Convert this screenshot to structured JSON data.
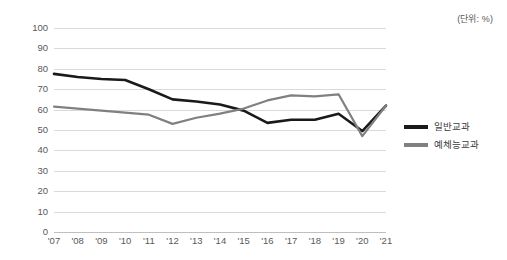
{
  "unit_note": "(단위: %)",
  "chart_data": {
    "type": "line",
    "title": "",
    "subtitle": "",
    "xlabel": "",
    "ylabel": "",
    "unit": "%",
    "grid": true,
    "legend_position": "right",
    "ylim": [
      0,
      100
    ],
    "ytick_step": 10,
    "yticks": [
      "100",
      "90",
      "80",
      "70",
      "60",
      "50",
      "40",
      "30",
      "20",
      "10",
      "0"
    ],
    "categories": [
      "'07",
      "'08",
      "'09",
      "'10",
      "'11",
      "'12",
      "'13",
      "'14",
      "'15",
      "'16",
      "'17",
      "'18",
      "'19",
      "'20",
      "'21"
    ],
    "series": [
      {
        "name": "일반교과",
        "color": "#1a1a1a",
        "values": [
          77.5,
          76.0,
          75.0,
          74.5,
          70.0,
          65.0,
          64.0,
          62.5,
          59.5,
          53.5,
          55.0,
          55.0,
          58.0,
          49.5,
          62.0
        ]
      },
      {
        "name": "예체능교과",
        "color": "#808080",
        "values": [
          61.5,
          60.5,
          59.5,
          58.5,
          57.5,
          53.0,
          56.0,
          58.0,
          60.5,
          64.5,
          67.0,
          66.5,
          67.5,
          47.0,
          62.0
        ]
      }
    ]
  },
  "legend": {
    "items": [
      {
        "label": "일반교과",
        "color": "#1a1a1a"
      },
      {
        "label": "예체능교과",
        "color": "#808080"
      }
    ]
  },
  "colors": {
    "series_primary": "#1a1a1a",
    "series_secondary": "#808080",
    "gridline": "#d9d9d9",
    "axis_text": "#595959",
    "background": "#ffffff"
  }
}
